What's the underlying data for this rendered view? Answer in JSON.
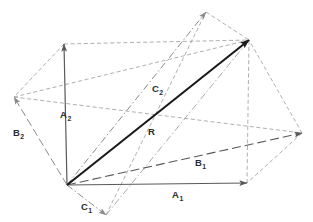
{
  "figure": {
    "width": 313,
    "height": 222,
    "background_color": "#ffffff",
    "origin": {
      "x": 67,
      "y": 185
    },
    "resultant_point": {
      "x": 249,
      "y": 40
    }
  },
  "colors": {
    "solid_vector": "#5a5a5a",
    "resultant_vector": "#1a1a1a",
    "dashed_construction": "#9a9a9a",
    "dashdot_construction": "#8f8f8f",
    "label_text": "#2b2b2b"
  },
  "labels": {
    "a1": {
      "base": "A",
      "sub": "1",
      "x": 172,
      "y": 198
    },
    "a2": {
      "base": "A",
      "sub": "2",
      "x": 60,
      "y": 118
    },
    "b1": {
      "base": "B",
      "sub": "1",
      "x": 195,
      "y": 166
    },
    "b2": {
      "base": "B",
      "sub": "2",
      "x": 13,
      "y": 136
    },
    "c1": {
      "base": "C",
      "sub": "1",
      "x": 81,
      "y": 210
    },
    "c2": {
      "base": "C",
      "sub": "2",
      "x": 152,
      "y": 92
    },
    "r": {
      "base": "R",
      "sub": "",
      "x": 148,
      "y": 135
    }
  },
  "vectors": [
    {
      "name": "A1",
      "label": "A₁",
      "style": "solid",
      "color": "#5a5a5a",
      "arrow": true,
      "x1": 67,
      "y1": 185,
      "x2": 247,
      "y2": 183,
      "width": 1.2
    },
    {
      "name": "A2",
      "label": "A₂",
      "style": "solid",
      "color": "#5a5a5a",
      "arrow": true,
      "x1": 67,
      "y1": 185,
      "x2": 64,
      "y2": 44,
      "width": 1.2
    },
    {
      "name": "B1",
      "label": "B₁",
      "style": "dashed-long",
      "color": "#5a5a5a",
      "arrow": true,
      "x1": 67,
      "y1": 185,
      "x2": 302,
      "y2": 133,
      "width": 1.1
    },
    {
      "name": "B2",
      "label": "B₂",
      "style": "dashed-long",
      "color": "#8a8a8a",
      "arrow": true,
      "x1": 67,
      "y1": 185,
      "x2": 14,
      "y2": 97,
      "width": 1.0
    },
    {
      "name": "C1",
      "label": "C₁",
      "style": "dashdot",
      "color": "#8a8a8a",
      "arrow": true,
      "x1": 67,
      "y1": 185,
      "x2": 106,
      "y2": 215,
      "width": 1.0
    },
    {
      "name": "C2",
      "label": "C₂",
      "style": "dashdot",
      "color": "#8a8a8a",
      "arrow": true,
      "x1": 67,
      "y1": 185,
      "x2": 206,
      "y2": 12,
      "width": 1.0
    },
    {
      "name": "R",
      "label": "R",
      "style": "solid",
      "color": "#1a1a1a",
      "arrow": true,
      "x1": 67,
      "y1": 185,
      "x2": 249,
      "y2": 40,
      "width": 2.1
    }
  ],
  "construction_lines": [
    {
      "name": "a2-tip-to-resultant",
      "style": "dashed",
      "x1": 64,
      "y1": 44,
      "x2": 249,
      "y2": 40
    },
    {
      "name": "a1-tip-to-resultant",
      "style": "dashed",
      "x1": 247,
      "y1": 183,
      "x2": 249,
      "y2": 40
    },
    {
      "name": "b2-tip-to-resultant",
      "style": "dashed",
      "x1": 14,
      "y1": 97,
      "x2": 249,
      "y2": 40
    },
    {
      "name": "b1-tip-to-resultant",
      "style": "dashed",
      "x1": 302,
      "y1": 133,
      "x2": 249,
      "y2": 40
    },
    {
      "name": "c2-tip-to-resultant",
      "style": "dashed",
      "x1": 206,
      "y1": 12,
      "x2": 249,
      "y2": 40
    },
    {
      "name": "c1-tip-to-resultant",
      "style": "dashdot",
      "x1": 106,
      "y1": 215,
      "x2": 249,
      "y2": 40
    },
    {
      "name": "a2-tip-to-b2-tip",
      "style": "dashed",
      "x1": 64,
      "y1": 44,
      "x2": 14,
      "y2": 97
    },
    {
      "name": "b1-tip-to-a1-tip",
      "style": "dashed",
      "x1": 302,
      "y1": 133,
      "x2": 247,
      "y2": 183
    },
    {
      "name": "b2-tip-long-edge",
      "style": "dashed",
      "x1": 14,
      "y1": 97,
      "x2": 302,
      "y2": 133
    },
    {
      "name": "c1-tip-to-c2-tip",
      "style": "dashed",
      "x1": 106,
      "y1": 215,
      "x2": 206,
      "y2": 12
    }
  ]
}
